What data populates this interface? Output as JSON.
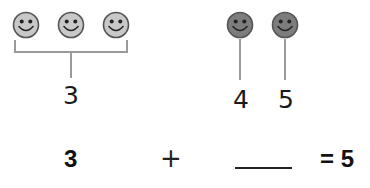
{
  "colors": {
    "group_a_face": "#c8c8c8",
    "group_b_face": "#7d7d7d",
    "outline": "#555555",
    "connector": "#9a9a9a",
    "text": "#1a1a1a"
  },
  "group_a": {
    "count": 3,
    "icon": "smiley-face-icon",
    "label": "3"
  },
  "group_b": {
    "count": 2,
    "icon": "smiley-face-icon",
    "labels": [
      "4",
      "5"
    ]
  },
  "equation": {
    "left": "3",
    "operator": "+",
    "blank": "",
    "result": "= 5"
  }
}
